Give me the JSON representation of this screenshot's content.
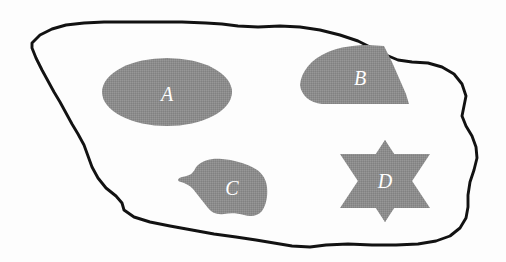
{
  "figure": {
    "name": "shaded-regions-diagram",
    "background_color": "#fdfdfd",
    "boundary_color": "#121212",
    "fill_color": "#8c8c8c",
    "label_color": "#ffffff",
    "width": 506,
    "height": 262
  },
  "outer_region": {
    "name": "outer-boundary",
    "description": "large irregular hand-drawn closed curve"
  },
  "regions": [
    {
      "id": "A",
      "label": "A",
      "shape": "ellipse",
      "fill": "#8c8c8c",
      "label_x": 167,
      "label_y": 96,
      "cx": 167,
      "cy": 92,
      "rx": 65,
      "ry": 34
    },
    {
      "id": "B",
      "label": "B",
      "shape": "fan-wedge",
      "fill": "#8c8c8c",
      "label_x": 360,
      "label_y": 80,
      "path": "M 300 85 C 303 66 322 52 348 48 L 390 47 L 408 104 L 330 104 C 314 104 302 96 300 85 Z"
    },
    {
      "id": "C",
      "label": "C",
      "shape": "irregular-blob",
      "fill": "#8c8c8c",
      "label_x": 232,
      "label_y": 190,
      "path": "M 196 167 C 202 161 210 159 219 160 C 232 161 243 164 252 168 C 260 172 266 179 267 188 C 268 198 266 206 262 212 C 258 217 250 217 243 215 C 236 213 229 213 223 214 C 216 215 211 214 207 209 C 202 203 197 196 192 190 C 188 186 184 184 180 183 C 176 182 177 179 181 178 C 186 177 190 176 192 173 C 194 171 194 169 196 167 Z"
    },
    {
      "id": "D",
      "label": "D",
      "shape": "six-pointed-star",
      "fill": "#8c8c8c",
      "label_x": 385,
      "label_y": 183,
      "cx": 385,
      "cy": 181,
      "outer_r": 52,
      "inner_r": 27
    }
  ],
  "labels": [
    "A",
    "B",
    "C",
    "D"
  ]
}
